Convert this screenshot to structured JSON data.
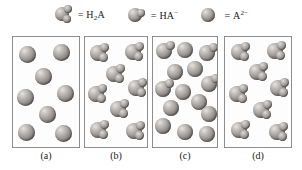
{
  "figure": {
    "title_present": false,
    "background_color": "#ffffff",
    "panel_border_color": "#8e8e8e",
    "sphere_color": "#a9a5a2"
  },
  "legend": {
    "items": [
      {
        "icon": "h2a-molecule-icon",
        "equals": "=",
        "label": "H",
        "sub": "2",
        "tail": "A",
        "species": "H2A",
        "lobes": 2
      },
      {
        "icon": "ha-minus-molecule-icon",
        "equals": "=",
        "label": "HA",
        "sup": "−",
        "species": "HA-",
        "lobes": 1
      },
      {
        "icon": "a-2minus-ion-icon",
        "equals": "=",
        "label": "A",
        "sup": "2−",
        "species": "A2-",
        "lobes": 0
      }
    ]
  },
  "panels": [
    {
      "id": "a",
      "label": "(a)",
      "particle_count": 8,
      "composition": "all A2- ions (fully deprotonated)",
      "particles": [
        {
          "species": "A2-",
          "x": 6,
          "y": 6,
          "d": 17,
          "lobes": 0
        },
        {
          "species": "A2-",
          "x": 40,
          "y": 4,
          "d": 17,
          "lobes": 0
        },
        {
          "species": "A2-",
          "x": 22,
          "y": 28,
          "d": 17,
          "lobes": 0
        },
        {
          "species": "A2-",
          "x": 44,
          "y": 45,
          "d": 17,
          "lobes": 0
        },
        {
          "species": "A2-",
          "x": 4,
          "y": 49,
          "d": 17,
          "lobes": 0
        },
        {
          "species": "A2-",
          "x": 26,
          "y": 66,
          "d": 17,
          "lobes": 0
        },
        {
          "species": "A2-",
          "x": 5,
          "y": 84,
          "d": 17,
          "lobes": 0
        },
        {
          "species": "A2-",
          "x": 42,
          "y": 85,
          "d": 17,
          "lobes": 0
        }
      ]
    },
    {
      "id": "b",
      "label": "(b)",
      "particle_count": 8,
      "composition": "all H2A molecules (fully protonated)",
      "particles": [
        {
          "species": "H2A",
          "x": 5,
          "y": 5,
          "d": 16,
          "lobes": 2
        },
        {
          "species": "H2A",
          "x": 40,
          "y": 4,
          "d": 16,
          "lobes": 2
        },
        {
          "species": "H2A",
          "x": 21,
          "y": 26,
          "d": 16,
          "lobes": 2
        },
        {
          "species": "H2A",
          "x": 43,
          "y": 40,
          "d": 16,
          "lobes": 2
        },
        {
          "species": "H2A",
          "x": 3,
          "y": 46,
          "d": 16,
          "lobes": 2
        },
        {
          "species": "H2A",
          "x": 25,
          "y": 61,
          "d": 16,
          "lobes": 2
        },
        {
          "species": "H2A",
          "x": 5,
          "y": 82,
          "d": 16,
          "lobes": 2
        },
        {
          "species": "H2A",
          "x": 41,
          "y": 83,
          "d": 16,
          "lobes": 2
        }
      ]
    },
    {
      "id": "c",
      "label": "(c)",
      "particle_count": 14,
      "composition": "mixture, mostly A2- with some HA-",
      "particles": [
        {
          "species": "HA-",
          "x": 3,
          "y": 3,
          "d": 16,
          "lobes": 1
        },
        {
          "species": "A2-",
          "x": 24,
          "y": 2,
          "d": 16,
          "lobes": 0
        },
        {
          "species": "HA-",
          "x": 46,
          "y": 5,
          "d": 16,
          "lobes": 1
        },
        {
          "species": "A2-",
          "x": 14,
          "y": 24,
          "d": 16,
          "lobes": 0
        },
        {
          "species": "A2-",
          "x": 34,
          "y": 21,
          "d": 16,
          "lobes": 0
        },
        {
          "species": "HA-",
          "x": 48,
          "y": 36,
          "d": 16,
          "lobes": 1
        },
        {
          "species": "HA-",
          "x": 2,
          "y": 41,
          "d": 16,
          "lobes": 1
        },
        {
          "species": "A2-",
          "x": 22,
          "y": 44,
          "d": 16,
          "lobes": 0
        },
        {
          "species": "A2-",
          "x": 38,
          "y": 54,
          "d": 16,
          "lobes": 0
        },
        {
          "species": "A2-",
          "x": 10,
          "y": 60,
          "d": 16,
          "lobes": 0
        },
        {
          "species": "A2-",
          "x": 48,
          "y": 66,
          "d": 16,
          "lobes": 0
        },
        {
          "species": "A2-",
          "x": 2,
          "y": 78,
          "d": 16,
          "lobes": 0
        },
        {
          "species": "A2-",
          "x": 24,
          "y": 84,
          "d": 16,
          "lobes": 0
        },
        {
          "species": "A2-",
          "x": 46,
          "y": 86,
          "d": 16,
          "lobes": 0
        }
      ]
    },
    {
      "id": "d",
      "label": "(d)",
      "particle_count": 8,
      "composition": "all H2A molecules (fully protonated)",
      "particles": [
        {
          "species": "H2A",
          "x": 6,
          "y": 4,
          "d": 16,
          "lobes": 2
        },
        {
          "species": "H2A",
          "x": 42,
          "y": 3,
          "d": 16,
          "lobes": 2
        },
        {
          "species": "H2A",
          "x": 24,
          "y": 24,
          "d": 16,
          "lobes": 2
        },
        {
          "species": "H2A",
          "x": 45,
          "y": 40,
          "d": 16,
          "lobes": 2
        },
        {
          "species": "H2A",
          "x": 4,
          "y": 46,
          "d": 16,
          "lobes": 2
        },
        {
          "species": "H2A",
          "x": 28,
          "y": 62,
          "d": 16,
          "lobes": 2
        },
        {
          "species": "H2A",
          "x": 6,
          "y": 82,
          "d": 16,
          "lobes": 2
        },
        {
          "species": "H2A",
          "x": 44,
          "y": 84,
          "d": 16,
          "lobes": 2
        }
      ]
    }
  ],
  "panel_geometry": [
    {
      "left": 12,
      "top": 36,
      "width": 68,
      "height": 112,
      "label_left": 12,
      "label_top": 150,
      "label_width": 68
    },
    {
      "left": 84,
      "top": 36,
      "width": 64,
      "height": 112,
      "label_left": 84,
      "label_top": 150,
      "label_width": 64
    },
    {
      "left": 152,
      "top": 36,
      "width": 66,
      "height": 112,
      "label_left": 152,
      "label_top": 150,
      "label_width": 66
    },
    {
      "left": 224,
      "top": 36,
      "width": 68,
      "height": 112,
      "label_left": 224,
      "label_top": 150,
      "label_width": 68
    }
  ]
}
